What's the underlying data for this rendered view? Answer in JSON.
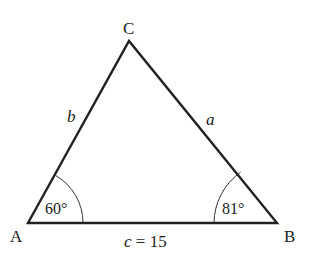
{
  "diagram": {
    "type": "triangle",
    "vertices": {
      "A": {
        "label": "A"
      },
      "B": {
        "label": "B"
      },
      "C": {
        "label": "C"
      }
    },
    "sides": {
      "a": {
        "label": "a"
      },
      "b": {
        "label": "b"
      },
      "c": {
        "label": "c",
        "value_text": "= 15"
      }
    },
    "angles": {
      "A": {
        "label": "60°"
      },
      "B": {
        "label": "81°"
      }
    },
    "stroke_color": "#222222"
  }
}
